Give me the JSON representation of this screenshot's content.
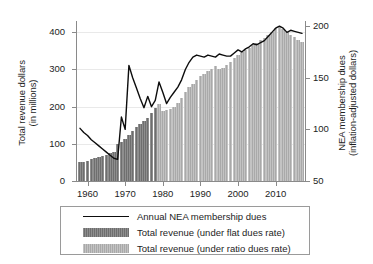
{
  "chart_data": {
    "type": "bar",
    "title": "",
    "subtitle": "",
    "xlabel": "",
    "ylabel": "Total revenue dollars (in millions)",
    "ylabel_line1": "Total revenue dollars",
    "ylabel_line2": "(in millions)",
    "y2label": "NEA membership dues (inflation-adjusted dollars)",
    "y2label_line1": "NEA membership dues",
    "y2label_line2": "(inflation-adjusted dollars)",
    "grid": true,
    "legend_position": "below-plot",
    "xlim": [
      1957.2,
      2017.8
    ],
    "ylim": [
      0,
      430
    ],
    "y2lim": [
      50,
      205
    ],
    "xticks": [
      "1960",
      "1970",
      "1980",
      "1990",
      "2000",
      "2010"
    ],
    "xtick_values": [
      1960,
      1970,
      1980,
      1990,
      2000,
      2010
    ],
    "yticks": [
      "0",
      "100",
      "200",
      "300",
      "400"
    ],
    "ytick_values": [
      0,
      100,
      200,
      300,
      400
    ],
    "y2ticks": [
      "50",
      "100",
      "150",
      "200"
    ],
    "y2tick_values": [
      50,
      100,
      150,
      200
    ],
    "colors": {
      "flat_bar": "#6e6e6e",
      "ratio_bar": "#a9a9a9",
      "line": "#0d0d0d",
      "grid": "#e9e9e9",
      "axis": "#8a8a8a"
    },
    "legend": [
      {
        "key": "line",
        "label": "Annual NEA membership dues"
      },
      {
        "key": "flat",
        "label": "Total revenue (under flat dues rate)"
      },
      {
        "key": "ratio",
        "label": "Total revenue (under ratio dues rate)"
      }
    ],
    "series": [
      {
        "name": "Total revenue (under flat dues rate)",
        "axis": "left",
        "style": "bar",
        "x": [
          1958,
          1959,
          1960,
          1961,
          1962,
          1963,
          1964,
          1965,
          1966,
          1967,
          1968,
          1969,
          1970,
          1971,
          1972,
          1973,
          1974,
          1975,
          1976,
          1977,
          1978
        ],
        "values": [
          50,
          52,
          55,
          58,
          62,
          65,
          68,
          71,
          75,
          79,
          100,
          104,
          112,
          124,
          135,
          144,
          152,
          160,
          170,
          182,
          196
        ]
      },
      {
        "name": "Total revenue (under ratio dues rate)",
        "axis": "left",
        "style": "bar",
        "x": [
          1979,
          1980,
          1981,
          1982,
          1983,
          1984,
          1985,
          1986,
          1987,
          1988,
          1989,
          1990,
          1991,
          1992,
          1993,
          1994,
          1995,
          1996,
          1997,
          1998,
          1999,
          2000,
          2001,
          2002,
          2003,
          2004,
          2005,
          2006,
          2007,
          2008,
          2009,
          2010,
          2011,
          2012,
          2013,
          2014,
          2015,
          2016,
          2017
        ],
        "values": [
          207,
          188,
          190,
          194,
          200,
          210,
          222,
          238,
          252,
          262,
          272,
          282,
          288,
          295,
          300,
          310,
          300,
          305,
          312,
          320,
          330,
          340,
          348,
          352,
          358,
          366,
          372,
          378,
          385,
          392,
          400,
          410,
          415,
          408,
          400,
          392,
          386,
          380,
          374
        ]
      },
      {
        "name": "Annual NEA membership dues",
        "axis": "right",
        "style": "line",
        "x": [
          1958,
          1959,
          1960,
          1961,
          1962,
          1963,
          1964,
          1965,
          1966,
          1967,
          1968,
          1969,
          1970,
          1971,
          1972,
          1973,
          1974,
          1975,
          1976,
          1977,
          1978,
          1979,
          1980,
          1981,
          1982,
          1983,
          1984,
          1985,
          1986,
          1987,
          1988,
          1989,
          1990,
          1991,
          1992,
          1993,
          1994,
          1995,
          1996,
          1997,
          1998,
          1999,
          2000,
          2001,
          2002,
          2003,
          2004,
          2005,
          2006,
          2007,
          2008,
          2009,
          2010,
          2011,
          2012,
          2013,
          2014,
          2015,
          2016,
          2017
        ],
        "values": [
          101,
          97,
          94,
          90,
          87,
          84,
          81,
          78,
          75,
          72,
          71,
          112,
          100,
          162,
          150,
          140,
          130,
          121,
          132,
          122,
          128,
          146,
          136,
          125,
          131,
          136,
          141,
          148,
          158,
          165,
          170,
          172,
          171,
          170,
          172,
          171,
          170,
          173,
          172,
          171,
          171,
          174,
          177,
          175,
          178,
          180,
          183,
          182,
          184,
          186,
          190,
          194,
          198,
          200,
          198,
          194,
          196,
          195,
          194,
          193
        ]
      }
    ]
  }
}
